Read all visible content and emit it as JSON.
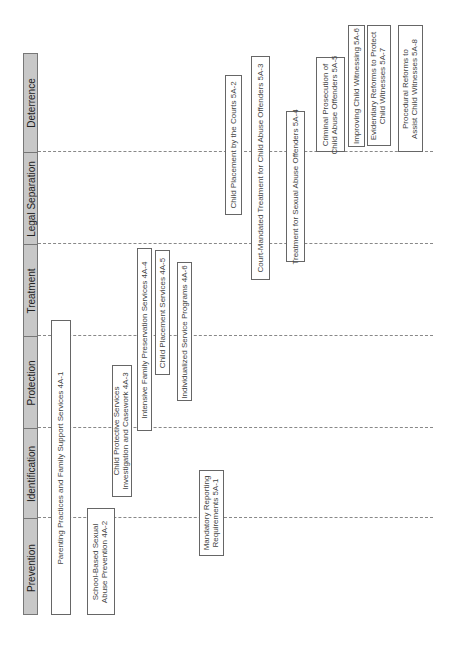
{
  "diagram": {
    "orientation": "rotated-90-ccw",
    "header": {
      "columns": [
        {
          "label": "Deterrence",
          "top": 53,
          "height": 98
        },
        {
          "label": "Legal Separation",
          "top": 151,
          "height": 92
        },
        {
          "label": "Treatment",
          "top": 243,
          "height": 92
        },
        {
          "label": "Protection",
          "top": 335,
          "height": 92
        },
        {
          "label": "Identification",
          "top": 427,
          "height": 90
        },
        {
          "label": "Prevention",
          "top": 517,
          "height": 98
        }
      ],
      "fill_color": "#c8c8c8"
    },
    "dividers": [
      151,
      243,
      335,
      427,
      517
    ],
    "boxes": [
      {
        "id": "4A-1",
        "label": "Parenting Practices and Family Support Services 4A-1",
        "x": 51,
        "y": 320,
        "w": 20,
        "h": 295
      },
      {
        "id": "4A-2",
        "label": "School-Based Sexual\nAbuse Prevention 4A-2",
        "x": 87,
        "y": 508,
        "w": 28,
        "h": 107
      },
      {
        "id": "4A-3",
        "label": "Child Protective Services\nInvestigation and Casework 4A-3",
        "x": 112,
        "y": 365,
        "w": 20,
        "h": 132
      },
      {
        "id": "4A-4",
        "label": "Intensive Family Preservation Services 4A-4",
        "x": 137,
        "y": 248,
        "w": 15,
        "h": 183
      },
      {
        "id": "4A-5",
        "label": "Child Placement Services 4A-5",
        "x": 155,
        "y": 250,
        "w": 15,
        "h": 125
      },
      {
        "id": "4A-6",
        "label": "Individualized Service Programs 4A-6",
        "x": 177,
        "y": 262,
        "w": 15,
        "h": 139
      },
      {
        "id": "5A-1",
        "label": "Mandatory Reporting\nRequirements 5A-1",
        "x": 199,
        "y": 470,
        "w": 25,
        "h": 86
      },
      {
        "id": "5A-2",
        "label": "Child Placement by the Courts 5A-2",
        "x": 225,
        "y": 75,
        "w": 17,
        "h": 140
      },
      {
        "id": "5A-3",
        "label": "Court-Mandated Treatment for Child Abuse Offenders 5A-3",
        "x": 251,
        "y": 56,
        "w": 19,
        "h": 224
      },
      {
        "id": "5A-4",
        "label": "Treatment for Sexual Abuse Offenders 5A-4",
        "x": 286,
        "y": 111,
        "w": 19,
        "h": 151
      },
      {
        "id": "5A-5",
        "label": "Criminal Prosecution of\nChild Abuse Offenders 5A-5",
        "x": 316,
        "y": 57,
        "w": 29,
        "h": 95
      },
      {
        "id": "5A-6",
        "label": "Improving Child Witnessing 5A-6",
        "x": 348,
        "y": 25,
        "w": 17,
        "h": 122
      },
      {
        "id": "5A-7",
        "label": "Evidentiary Reforms to Protect\nChild Witnesses 5A-7",
        "x": 367,
        "y": 25,
        "w": 24,
        "h": 121
      },
      {
        "id": "5A-8",
        "label": "Procedural Reforms to\nAssist Child Witnesses 5A-8",
        "x": 398,
        "y": 25,
        "w": 25,
        "h": 127
      }
    ]
  }
}
